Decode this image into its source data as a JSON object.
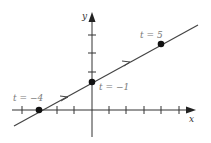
{
  "figure": {
    "axes": {
      "x_label": "x",
      "y_label": "y"
    },
    "line": {
      "description": "parametric line x = t + 1, y = (t + 4)/2",
      "direction": "increasing t"
    },
    "points": [
      {
        "label": "t = −4",
        "x": -3,
        "y": 0
      },
      {
        "label": "t = −1",
        "x": 0,
        "y": 1.5
      },
      {
        "label": "t = 5",
        "x": 4,
        "y": 3.5
      }
    ],
    "x_ticks": [
      -4,
      -3,
      -2,
      -1,
      1,
      2,
      3,
      4,
      5
    ],
    "y_ticks": [
      1,
      2,
      3,
      4
    ]
  }
}
